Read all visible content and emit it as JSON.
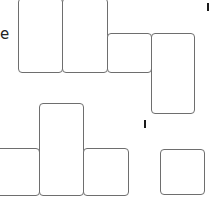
{
  "diagram": {
    "type": "tile-arrangement",
    "text_fragment": "e",
    "tiles": [
      {
        "id": "A",
        "x": 18,
        "y": -2,
        "w": 45,
        "h": 75
      },
      {
        "id": "B",
        "x": 62,
        "y": -2,
        "w": 46,
        "h": 75
      },
      {
        "id": "C",
        "x": 107,
        "y": 33,
        "w": 45,
        "h": 40
      },
      {
        "id": "D",
        "x": 151,
        "y": 33,
        "w": 44,
        "h": 81
      },
      {
        "id": "E",
        "x": -4,
        "y": 148,
        "w": 44,
        "h": 48
      },
      {
        "id": "F",
        "x": 39,
        "y": 103,
        "w": 45,
        "h": 93
      },
      {
        "id": "G",
        "x": 83,
        "y": 148,
        "w": 46,
        "h": 48
      },
      {
        "id": "H",
        "x": 160,
        "y": 149,
        "w": 45,
        "h": 46
      }
    ],
    "ticks": [
      {
        "x": 207,
        "y": 3
      },
      {
        "x": 144,
        "y": 120
      }
    ],
    "colors": {
      "stroke": "#6e6e6e",
      "background": "#ffffff",
      "tick": "#1a1a1a"
    }
  }
}
